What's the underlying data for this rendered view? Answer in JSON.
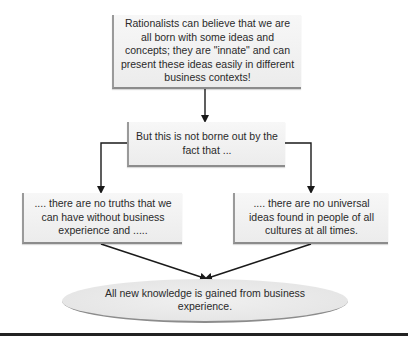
{
  "diagram": {
    "top_box": {
      "text": "Rationalists can believe that we are all born with some ideas and concepts; they are \"innate\" and can present these ideas easily in different business contexts!"
    },
    "middle_box": {
      "text": "But this is not borne out by the fact that ..."
    },
    "left_box": {
      "text": ".... there are no truths that we can have without business experience and ....."
    },
    "right_box": {
      "text": ".... there are no universal ideas found in people of all cultures at all times."
    },
    "conclusion": {
      "text": "All new knowledge is gained from business experience."
    },
    "connectors": [
      {
        "from": "top_box",
        "to": "middle_box",
        "type": "arrow"
      },
      {
        "from": "middle_box",
        "to": "left_box",
        "type": "elbow-arrow"
      },
      {
        "from": "middle_box",
        "to": "right_box",
        "type": "elbow-arrow"
      },
      {
        "from": "left_box",
        "to": "conclusion",
        "type": "arrow"
      },
      {
        "from": "right_box",
        "to": "conclusion",
        "type": "arrow"
      }
    ],
    "colors": {
      "box_fill": "#efefef",
      "box_edge": "#8c8c8c",
      "line": "#1a1a1a",
      "text": "#2a2a2a"
    }
  }
}
